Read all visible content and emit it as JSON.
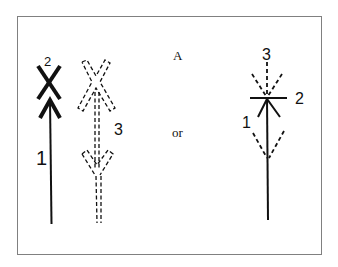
{
  "diagram": {
    "center_labels": {
      "top": "A",
      "middle": "or"
    },
    "left_figure": {
      "solid_arrow_label": "1",
      "cross_label": "2",
      "dashed_arrow_label": "3"
    },
    "right_figure": {
      "lower_dashed_label": "1",
      "bar_label": "2",
      "upper_dashed_label": "3"
    },
    "colors": {
      "ink": "#111111",
      "frame": "#808080",
      "background": "#ffffff"
    }
  }
}
